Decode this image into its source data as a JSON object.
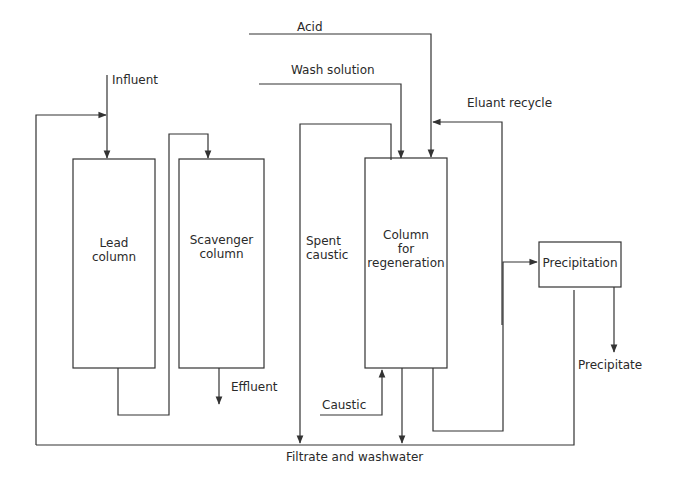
{
  "diagram": {
    "nodes": {
      "lead_column": [
        "Lead",
        "column"
      ],
      "scavenger_column": [
        "Scavenger",
        "column"
      ],
      "regen_column": [
        "Column",
        "for",
        "regeneration"
      ],
      "precipitation": "Precipitation"
    },
    "streams": {
      "influent": "Influent",
      "effluent": "Effluent",
      "acid": "Acid",
      "wash_solution": "Wash solution",
      "eluant_recycle": "Eluant recycle",
      "spent_caustic": [
        "Spent",
        "caustic"
      ],
      "caustic": "Caustic",
      "precipitate": "Precipitate",
      "filtrate": "Filtrate and washwater"
    },
    "edges": [
      {
        "from": "influent",
        "to": "lead_column"
      },
      {
        "from": "filtrate_and_washwater",
        "to": "lead_column"
      },
      {
        "from": "lead_column",
        "to": "scavenger_column"
      },
      {
        "from": "scavenger_column",
        "to": "effluent"
      },
      {
        "from": "acid",
        "to": "regen_column"
      },
      {
        "from": "wash_solution",
        "to": "regen_column"
      },
      {
        "from": "caustic",
        "to": "regen_column"
      },
      {
        "from": "regen_column",
        "to": "spent_caustic"
      },
      {
        "from": "regen_column",
        "to": "precipitation"
      },
      {
        "from": "regen_column",
        "to": "eluant_recycle"
      },
      {
        "from": "precipitation",
        "to": "precipitate"
      },
      {
        "from": "precipitation",
        "to": "filtrate_and_washwater"
      },
      {
        "from": "regen_column",
        "to": "filtrate_and_washwater"
      }
    ],
    "colors": {
      "line": "#333333",
      "text": "#2a2a2a",
      "background": "#ffffff"
    }
  }
}
